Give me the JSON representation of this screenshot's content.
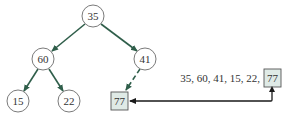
{
  "diagram": {
    "type": "binary-tree-insertion",
    "colors": {
      "edge": "#2f5e4a",
      "node_stroke": "#6b6b6b",
      "highlight_fill": "#dfeae6",
      "highlight_stroke": "#555555",
      "pointer": "#1a1a1a",
      "text": "#333333"
    },
    "tree": {
      "nodes": [
        {
          "id": "n35",
          "label": "35",
          "shape": "circle"
        },
        {
          "id": "n60",
          "label": "60",
          "shape": "circle"
        },
        {
          "id": "n41",
          "label": "41",
          "shape": "circle"
        },
        {
          "id": "n15",
          "label": "15",
          "shape": "circle"
        },
        {
          "id": "n22",
          "label": "22",
          "shape": "circle"
        },
        {
          "id": "n77",
          "label": "77",
          "shape": "square",
          "highlighted": true
        }
      ],
      "edges": [
        {
          "from": "35",
          "to": "60",
          "style": "solid"
        },
        {
          "from": "35",
          "to": "41",
          "style": "solid"
        },
        {
          "from": "60",
          "to": "15",
          "style": "solid"
        },
        {
          "from": "60",
          "to": "22",
          "style": "solid"
        },
        {
          "from": "41",
          "to": "77",
          "style": "dashed"
        }
      ]
    },
    "sequence": {
      "prefix": "35, 60, 41, 15, 22,",
      "new_item": "77"
    }
  }
}
